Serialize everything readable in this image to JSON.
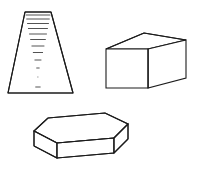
{
  "figure": {
    "canvas": {
      "width": 197,
      "height": 169,
      "background": "#ffffff"
    },
    "style": {
      "stroke_color": "#1c1c1c",
      "secondary_stroke_color": "#4a4a4a",
      "fill_color": "#ffffff",
      "stroke_width": 1.1
    },
    "shapes": [
      {
        "id": "perspective-ladder",
        "name": "ladder-trapezoid",
        "label": "Perspective ladder / tapered staircase",
        "position": "top-left",
        "outline_points": "25,12 51,12 73,93 8,93",
        "rung_count": 13,
        "rungs": [
          "25.6,15 50.4,15",
          "26.3,19 49.7,19",
          "27.1,23.5 48.9,23.5",
          "28.0,28.5 47.9,28.5",
          "29.1,34 46.9,34",
          "30.2,39.5 45.8,39.5",
          "31.5,46 44.4,46",
          "32.9,52.5 43.0,52.5",
          "34.5,60 41.4,60",
          "36.3,68 39.6,68",
          "38.3,77 37.5,77",
          "40.6,87 35.3,87"
        ]
      },
      {
        "id": "rectangular-prism",
        "name": "cuboid-box",
        "label": "Rectangular prism (cuboid)",
        "position": "top-right",
        "front_face": "106,49 148,49 148,88 106,88",
        "top_face": "106,49 144,33 186,40 148,49",
        "right_face": "148,49 186,40 186,78 148,88",
        "hidden_edges": false
      },
      {
        "id": "hexagonal-prism",
        "name": "hexagonal-slab",
        "label": "Hexagonal prism / slab",
        "position": "bottom-center",
        "top_face": "34,131 48,118 105,113 128,124 114,138 57,143",
        "front_left_face": "34,131 57,143 57,158 34,146",
        "front_center_face": "57,143 114,138 114,153 57,158",
        "front_right_face": "114,138 128,124 128,139 114,153"
      }
    ]
  }
}
